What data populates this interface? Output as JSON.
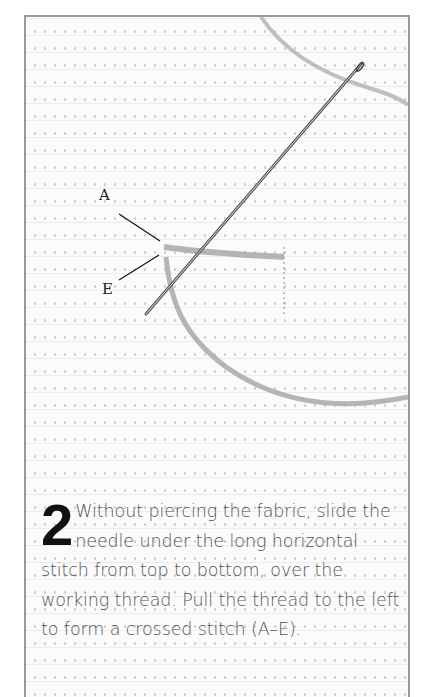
{
  "illustration": {
    "labels": {
      "a": "A",
      "e": "E"
    },
    "colors": {
      "frame": "#9a9a9a",
      "thread": "#a8a8a8",
      "needle": "#555555",
      "text": "#555555",
      "step_number": "#111111"
    }
  },
  "step": {
    "number": "2",
    "text": "Without piercing the fabric, slide the needle under the long horizontal stitch from top to bottom, over the working thread. Pull the thread to the left to form a crossed stitch (A–E)."
  }
}
